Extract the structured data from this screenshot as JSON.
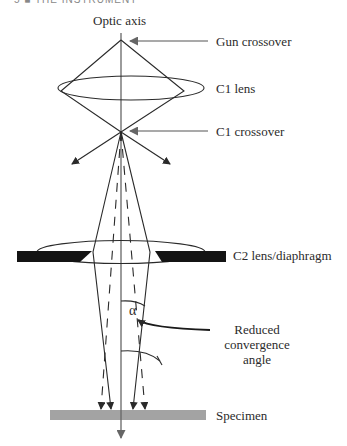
{
  "header": {
    "text": "5 ■ THE INSTRUMENT"
  },
  "labels": {
    "optic_axis": "Optic axis",
    "gun_crossover": "Gun crossover",
    "c1_lens": "C1 lens",
    "c1_crossover": "C1 crossover",
    "c2_lens": "C2 lens/diaphragm",
    "alpha": "α",
    "reduced_line1": "Reduced",
    "reduced_line2": "convergence",
    "reduced_line3": "angle",
    "specimen": "Specimen"
  },
  "colors": {
    "line": "#2a2a2a",
    "axis": "#555555",
    "diaphragm": "#141414",
    "specimen": "#a3a3a3"
  }
}
